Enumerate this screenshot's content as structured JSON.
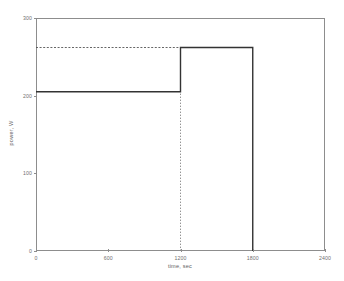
{
  "chart_data": {
    "type": "line",
    "title": "",
    "subtitle": "",
    "xlabel": "time, sec",
    "ylabel": "power, W",
    "xlim": [
      0,
      2400
    ],
    "ylim": [
      0,
      300
    ],
    "xticks": [
      0,
      600,
      1200,
      1800,
      2400
    ],
    "xtick_labels": [
      "0",
      "600",
      "1200",
      "1800",
      "2400"
    ],
    "yticks": [
      0,
      100,
      200,
      300
    ],
    "ytick_labels": [
      "0",
      "100",
      "200",
      "300"
    ],
    "grid": false,
    "legend": null,
    "series": [
      {
        "name": "power profile",
        "style": "step",
        "color": "#333333",
        "x": [
          0,
          1200,
          1200,
          1800,
          1800
        ],
        "y": [
          205,
          205,
          262,
          262,
          0
        ]
      }
    ],
    "annotations": [
      {
        "name": "peak-power-reference",
        "type": "hline",
        "value": 262,
        "style": "dotted",
        "color": "#555555",
        "x_from": 0,
        "x_to": 1800
      },
      {
        "name": "step-time-reference",
        "type": "vline",
        "value": 1200,
        "style": "dotted",
        "color": "#888888",
        "y_from": 0,
        "y_to": 262
      }
    ],
    "step_levels": [
      {
        "label": "baseline power",
        "from_sec": 0,
        "to_sec": 1200,
        "watts": 205
      },
      {
        "label": "peak power",
        "from_sec": 1200,
        "to_sec": 1800,
        "watts": 262
      },
      {
        "label": "off",
        "from_sec": 1800,
        "to_sec": 2400,
        "watts": 0
      }
    ]
  }
}
